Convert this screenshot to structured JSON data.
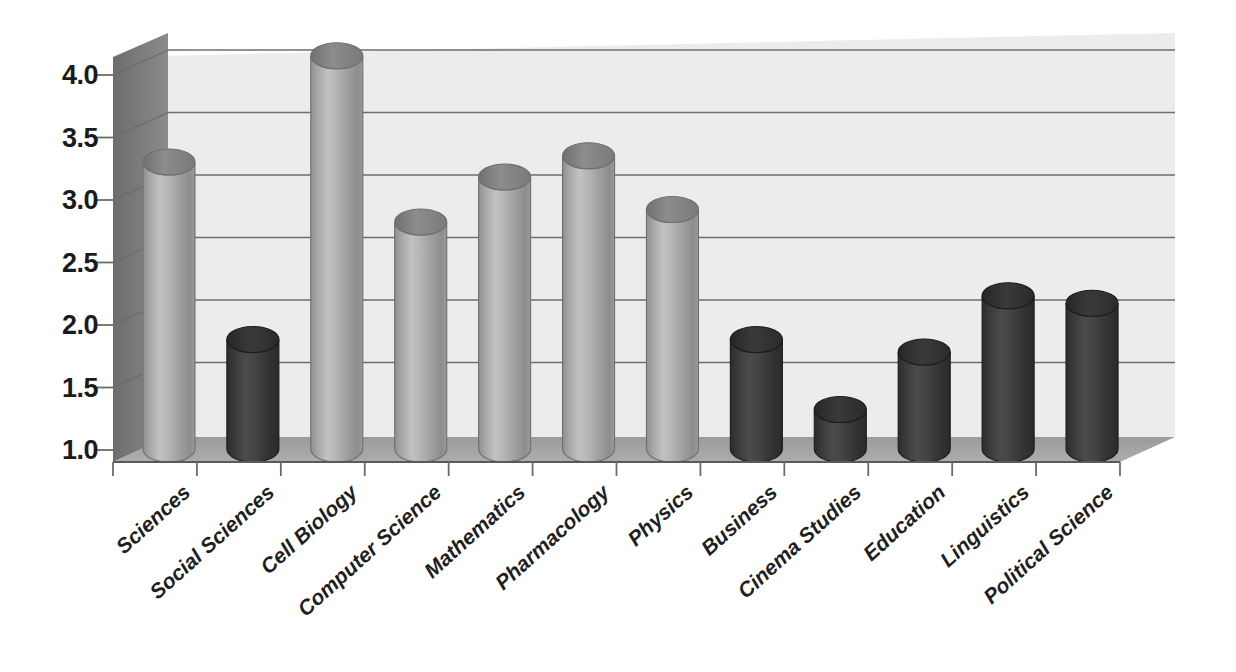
{
  "chart_data": {
    "type": "bar",
    "title": "",
    "subtitle": "",
    "xlabel": "",
    "ylabel": "",
    "categories": [
      "Sciences",
      "Social Sciences",
      "Cell Biology",
      "Computer Science",
      "Mathematics",
      "Pharmacology",
      "Physics",
      "Business",
      "Cinema Studies",
      "Education",
      "Linguistics",
      "Political Science"
    ],
    "values": [
      3.2,
      1.78,
      4.05,
      2.72,
      3.08,
      3.25,
      2.82,
      1.78,
      1.22,
      1.68,
      2.13,
      2.07
    ],
    "bar_colors": [
      "#a8a8a8",
      "#3d3d3d",
      "#a8a8a8",
      "#a8a8a8",
      "#a8a8a8",
      "#a8a8a8",
      "#a8a8a8",
      "#3d3d3d",
      "#3d3d3d",
      "#3d3d3d",
      "#3d3d3d",
      "#3d3d3d"
    ],
    "ylim": [
      1.0,
      4.3
    ],
    "yticks": [
      "4.0",
      "3.5",
      "3.0",
      "2.5",
      "2.0",
      "1.5",
      "1.0"
    ],
    "ytick_values": [
      4.0,
      3.5,
      3.0,
      2.5,
      2.0,
      1.5,
      1.0
    ],
    "grid": true,
    "legend": "none",
    "style": "3d-cylinder",
    "annotations": []
  },
  "palette": {
    "background": "#ffffff",
    "wall_back": "#ececec",
    "wall_side": "#7f7f7f",
    "floor": "#a3a3a3",
    "gridline": "#6e6e6e",
    "text": "#1b1b1b",
    "bar_light": "#a8a8a8",
    "bar_dark": "#3d3d3d"
  }
}
